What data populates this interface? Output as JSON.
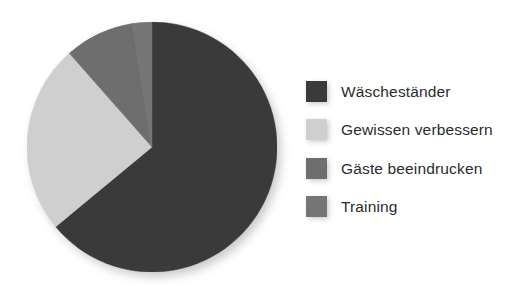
{
  "chart_data": {
    "type": "pie",
    "title": "",
    "subtitle": "",
    "xlabel": "",
    "ylabel": "",
    "grid": false,
    "legend_position": "right",
    "start_angle_deg": 0,
    "direction": "clockwise",
    "categories": [
      "Wäscheständer",
      "Gewissen verbessern",
      "Gäste beeindrucken",
      "Training"
    ],
    "values": [
      64.0,
      24.5,
      9.0,
      2.5
    ],
    "value_unit": "percent",
    "colors": [
      "#3a3a3a",
      "#cfcfcf",
      "#6e6e6e",
      "#757575"
    ],
    "slices": [
      {
        "label": "Wäscheständer",
        "value": 64.0,
        "color": "#3a3a3a",
        "start_deg": 0,
        "end_deg": 230.4
      },
      {
        "label": "Gewissen verbessern",
        "value": 24.5,
        "color": "#cfcfcf",
        "start_deg": 230.4,
        "end_deg": 318.6
      },
      {
        "label": "Gäste beeindrucken",
        "value": 9.0,
        "color": "#6e6e6e",
        "start_deg": 318.6,
        "end_deg": 351.0
      },
      {
        "label": "Training",
        "value": 2.5,
        "color": "#757575",
        "start_deg": 351.0,
        "end_deg": 360.0
      }
    ]
  },
  "legend": {
    "items": [
      {
        "label": "Wäscheständer",
        "color": "#3a3a3a",
        "swatch_name": "legend-swatch-waeschestaender"
      },
      {
        "label": "Gewissen verbessern",
        "color": "#cfcfcf",
        "swatch_name": "legend-swatch-gewissen-verbessern"
      },
      {
        "label": "Gäste beeindrucken",
        "color": "#6e6e6e",
        "swatch_name": "legend-swatch-gaeste-beeindrucken"
      },
      {
        "label": "Training",
        "color": "#757575",
        "swatch_name": "legend-swatch-training"
      }
    ]
  },
  "style": {
    "background": "#ffffff",
    "text_color": "#2b2b2b",
    "shadow_color": "#b9b9b9"
  }
}
